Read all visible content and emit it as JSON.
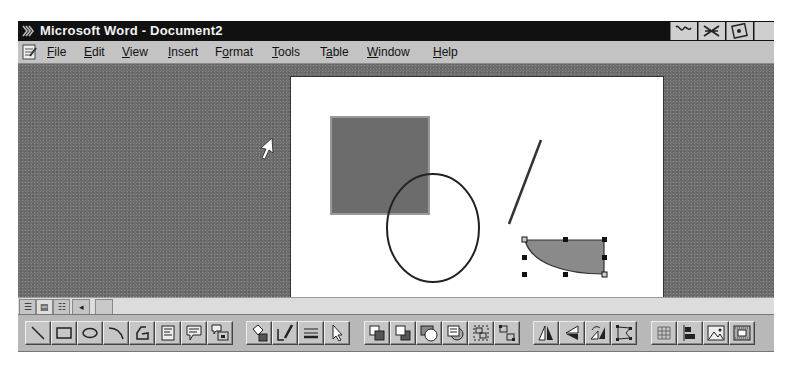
{
  "window": {
    "title": "Microsoft Word - Document2",
    "app_icon": "word-app-icon",
    "tray_icons": [
      "tray-icon-1",
      "tray-icon-2",
      "tray-icon-3",
      "tray-icon-4"
    ]
  },
  "menubar": {
    "doc_icon": "document-icon",
    "items": [
      {
        "label": "File",
        "accel": "F"
      },
      {
        "label": "Edit",
        "accel": "E"
      },
      {
        "label": "View",
        "accel": "V"
      },
      {
        "label": "Insert",
        "accel": "I"
      },
      {
        "label": "Format",
        "accel": "o"
      },
      {
        "label": "Tools",
        "accel": "T"
      },
      {
        "label": "Table",
        "accel": "a"
      },
      {
        "label": "Window",
        "accel": "W"
      },
      {
        "label": "Help",
        "accel": "H"
      }
    ]
  },
  "document": {
    "shapes": [
      {
        "type": "rectangle",
        "fill": "#6c6c6c",
        "x": 40,
        "y": 40,
        "w": 98,
        "h": 97
      },
      {
        "type": "ellipse",
        "fill": "none",
        "cx": 142,
        "cy": 151,
        "rx": 47,
        "ry": 54
      },
      {
        "type": "line",
        "x1": 250,
        "y1": 63,
        "x2": 218,
        "y2": 147
      },
      {
        "type": "arc-shape",
        "fill": "#8a8a8a",
        "selected": true
      }
    ],
    "colors": {
      "page": "#ffffff",
      "workspace": "#6e6e6e",
      "shape_fill": "#6c6c6c",
      "arc_fill": "#8a8a8a"
    }
  },
  "statusbar": {
    "view_buttons": [
      "normal-view",
      "page-layout-view",
      "outline-view"
    ],
    "scroll_left": "◂"
  },
  "drawing_toolbar": {
    "buttons": [
      "line",
      "rectangle",
      "ellipse",
      "arc",
      "freeform",
      "text-box",
      "callout",
      "format-callout",
      "fill-color",
      "line-color",
      "line-style",
      "select-drawing-objects",
      "bring-to-front",
      "send-to-back",
      "bring-in-front-of-text",
      "send-behind-text",
      "group",
      "ungroup",
      "flip-horizontal",
      "flip-vertical",
      "rotate-right",
      "reshape",
      "snap-to-grid",
      "align-drawing-objects",
      "create-picture",
      "insert-frame"
    ]
  }
}
